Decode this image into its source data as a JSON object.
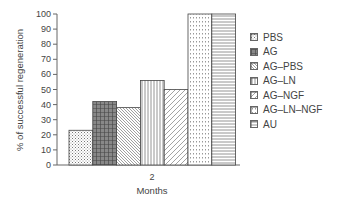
{
  "chart_data": {
    "type": "bar",
    "title": "",
    "xlabel": "Months",
    "ylabel": "% of successful regeneration",
    "categories": [
      "2"
    ],
    "ylim": [
      0,
      100
    ],
    "yticks": [
      0,
      10,
      20,
      30,
      40,
      50,
      60,
      70,
      80,
      90,
      100
    ],
    "grid": false,
    "legend_position": "right",
    "series": [
      {
        "name": "PBS",
        "values": [
          23
        ],
        "pattern": "dots"
      },
      {
        "name": "AG",
        "values": [
          42
        ],
        "pattern": "dark-grid"
      },
      {
        "name": "AG–PBS",
        "values": [
          38
        ],
        "pattern": "fine-diagonal"
      },
      {
        "name": "AG–LN",
        "values": [
          56
        ],
        "pattern": "vertical-lines"
      },
      {
        "name": "AG–NGF",
        "values": [
          50
        ],
        "pattern": "wide-diagonal"
      },
      {
        "name": "AG–LN–NGF",
        "values": [
          100
        ],
        "pattern": "small-grid-dots"
      },
      {
        "name": "AU",
        "values": [
          100
        ],
        "pattern": "horizontal-lines"
      }
    ]
  },
  "legend": {
    "items": [
      {
        "label": "PBS"
      },
      {
        "label": "AG"
      },
      {
        "label": "AG–PBS"
      },
      {
        "label": "AG–LN"
      },
      {
        "label": "AG–NGF"
      },
      {
        "label": "AG–LN–NGF"
      },
      {
        "label": "AU"
      }
    ]
  },
  "axes": {
    "ylabel": "% of successful regeneration",
    "xlabel": "Months",
    "xtick": "2",
    "yticks": [
      "0",
      "10",
      "20",
      "30",
      "40",
      "50",
      "60",
      "70",
      "80",
      "90",
      "100"
    ]
  }
}
